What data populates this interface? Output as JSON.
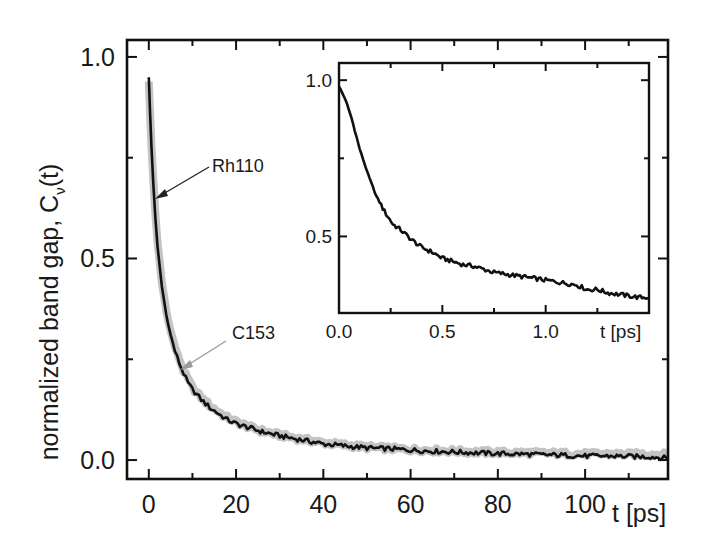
{
  "chart_data": [
    {
      "id": "main",
      "type": "line",
      "title": "",
      "xlabel": "t [ps]",
      "ylabel": "normalized band gap, C",
      "ylabel_subscript": "ν",
      "ylabel_suffix": "(t)",
      "xlim": [
        -5,
        119
      ],
      "ylim": [
        -0.047,
        1.042
      ],
      "x_ticks": [
        0,
        20,
        40,
        60,
        80,
        100
      ],
      "x_tick_labels": [
        "0",
        "20",
        "40",
        "60",
        "80",
        "100"
      ],
      "x_minor_ticks": [
        10,
        30,
        50,
        70,
        90,
        110
      ],
      "y_ticks": [
        0.0,
        0.5,
        1.0
      ],
      "y_tick_labels": [
        "0.0",
        "0.5",
        "1.0"
      ],
      "y_minor_ticks": [
        0.25,
        0.75
      ],
      "grid": false,
      "legend": "none (inline arrow annotations)",
      "series": [
        {
          "name": "Rh110",
          "style": "solid black line",
          "color": "#111111",
          "x": [
            0,
            0.3,
            0.6,
            1,
            1.5,
            2,
            3,
            4,
            5,
            6,
            7,
            8,
            9,
            10,
            12,
            14,
            16,
            18,
            20,
            23,
            26,
            30,
            35,
            40,
            45,
            50,
            55,
            60,
            65,
            70,
            75,
            80,
            85,
            90,
            95,
            100,
            105,
            110,
            115,
            119
          ],
          "values": [
            0.95,
            0.86,
            0.78,
            0.69,
            0.6,
            0.53,
            0.43,
            0.36,
            0.31,
            0.27,
            0.24,
            0.215,
            0.19,
            0.175,
            0.15,
            0.13,
            0.115,
            0.1,
            0.09,
            0.08,
            0.07,
            0.06,
            0.05,
            0.04,
            0.035,
            0.03,
            0.028,
            0.025,
            0.022,
            0.02,
            0.018,
            0.016,
            0.015,
            0.013,
            0.012,
            0.01,
            0.01,
            0.009,
            0.008,
            0.005
          ]
        },
        {
          "name": "C153",
          "style": "thick grey band",
          "color": "#c4c4c4",
          "x": [
            0,
            0.3,
            0.6,
            1,
            1.5,
            2,
            3,
            4,
            5,
            6,
            7,
            8,
            9,
            10,
            12,
            14,
            16,
            18,
            20,
            23,
            26,
            30,
            35,
            40,
            45,
            50,
            55,
            60,
            65,
            70,
            75,
            80,
            85,
            90,
            95,
            100,
            105,
            110,
            115,
            119
          ],
          "values": [
            0.94,
            0.86,
            0.78,
            0.7,
            0.61,
            0.54,
            0.44,
            0.37,
            0.32,
            0.28,
            0.25,
            0.22,
            0.2,
            0.18,
            0.155,
            0.135,
            0.12,
            0.105,
            0.095,
            0.082,
            0.072,
            0.062,
            0.052,
            0.043,
            0.037,
            0.032,
            0.029,
            0.026,
            0.024,
            0.022,
            0.02,
            0.019,
            0.018,
            0.017,
            0.016,
            0.015,
            0.015,
            0.014,
            0.014,
            0.013
          ]
        }
      ],
      "annotations": [
        {
          "text": "Rh110",
          "arrow_color": "#222222",
          "points_to": {
            "x": 0.9,
            "y": 0.73
          }
        },
        {
          "text": "C153",
          "arrow_color": "#9a9a9a",
          "points_to": {
            "x": 8.5,
            "y": 0.22
          }
        }
      ]
    },
    {
      "id": "inset",
      "type": "line",
      "title": "",
      "xlabel": "t [ps]",
      "ylabel": "",
      "xlim": [
        0,
        1.5
      ],
      "ylim": [
        0.255,
        1.055
      ],
      "x_ticks": [
        0.0,
        0.5,
        1.0
      ],
      "x_tick_labels": [
        "0.0",
        "0.5",
        "1.0"
      ],
      "x_minor_ticks": [
        0.25,
        0.75,
        1.25
      ],
      "y_ticks": [
        0.5,
        1.0
      ],
      "y_tick_labels": [
        "0.5",
        "1.0"
      ],
      "y_minor_ticks": [
        0.75
      ],
      "grid": false,
      "series": [
        {
          "name": "Rh110 (short times)",
          "color": "#111111",
          "x": [
            0.0,
            0.03,
            0.06,
            0.1,
            0.14,
            0.18,
            0.22,
            0.26,
            0.3,
            0.35,
            0.4,
            0.45,
            0.5,
            0.55,
            0.6,
            0.65,
            0.7,
            0.75,
            0.8,
            0.85,
            0.9,
            0.95,
            1.0,
            1.05,
            1.1,
            1.15,
            1.2,
            1.25,
            1.3,
            1.35,
            1.4,
            1.45,
            1.5
          ],
          "values": [
            0.98,
            0.94,
            0.88,
            0.78,
            0.7,
            0.63,
            0.58,
            0.54,
            0.52,
            0.49,
            0.465,
            0.45,
            0.43,
            0.42,
            0.41,
            0.405,
            0.395,
            0.385,
            0.38,
            0.375,
            0.37,
            0.365,
            0.36,
            0.355,
            0.35,
            0.345,
            0.33,
            0.33,
            0.32,
            0.315,
            0.31,
            0.305,
            0.305
          ]
        }
      ]
    }
  ],
  "labels": {
    "main_x_axis": "t [ps]",
    "inset_x_axis": "t [ps]",
    "y_axis_main": "normalized band gap, C",
    "y_axis_sub": "ν",
    "y_axis_suffix": "(t)",
    "annotation_rh110": "Rh110",
    "annotation_c153": "C153"
  },
  "colors": {
    "axis": "#111111",
    "rh110_line": "#111111",
    "c153_band": "#c4c4c4",
    "c153_arrow": "#9a9a9a",
    "background": "#ffffff"
  }
}
